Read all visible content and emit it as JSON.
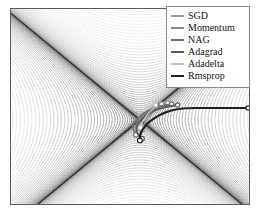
{
  "figure": {
    "kind": "contour-plot-with-trajectories",
    "frame_color": "#5a5a5a",
    "background_color": "#ffffff"
  },
  "legend": {
    "position": "top-right",
    "border_color": "#8a8a8a",
    "items": [
      {
        "label": "SGD",
        "color": "#9a9a9a",
        "width": 1.6
      },
      {
        "label": "Momentum",
        "color": "#8c8c8c",
        "width": 1.6
      },
      {
        "label": "NAG",
        "color": "#707070",
        "width": 1.8
      },
      {
        "label": "Adagrad",
        "color": "#5a5a5a",
        "width": 1.8
      },
      {
        "label": "Adadelta",
        "color": "#c2c2c2",
        "width": 1.6
      },
      {
        "label": "Rmsprop",
        "color": "#1e1e1e",
        "width": 2.2
      }
    ]
  },
  "chart_data": {
    "type": "line",
    "title": "",
    "xlabel": "",
    "ylabel": "",
    "xlim": [
      0,
      240
    ],
    "ylim": [
      0,
      197
    ],
    "grid": false,
    "legend_position": "top-right",
    "saddle_point": [
      130,
      112
    ],
    "contour": {
      "style": "thin grayscale level curves, dense near saddle ridges",
      "line_color_range": [
        "#d8d8d8",
        "#3a3a3a"
      ],
      "levels": 46,
      "families": [
        {
          "name": "upper-left-bands",
          "count": 16,
          "shade": "#9a9a9a"
        },
        {
          "name": "upper-right-bands",
          "count": 16,
          "shade": "#9a9a9a"
        },
        {
          "name": "lower-left-fan",
          "count": 15,
          "shade": "#c9c9c9"
        },
        {
          "name": "lower-right-fan",
          "count": 18,
          "shade": "#b5b5b5"
        },
        {
          "name": "central-vertical-ridge",
          "count": 13,
          "shade": "#6a6a6a"
        }
      ]
    },
    "series": [
      {
        "name": "SGD",
        "color": "#9a9a9a",
        "start": [
          152,
          96
        ],
        "end": [
          133,
          122
        ],
        "points": [
          [
            152,
            96
          ],
          [
            148,
            100
          ],
          [
            143,
            104
          ],
          [
            139,
            109
          ],
          [
            136,
            113
          ],
          [
            134,
            117
          ],
          [
            133,
            122
          ]
        ]
      },
      {
        "name": "Momentum",
        "color": "#8c8c8c",
        "start": [
          158,
          95
        ],
        "end": [
          128,
          125
        ],
        "points": [
          [
            158,
            95
          ],
          [
            150,
            99
          ],
          [
            141,
            103
          ],
          [
            133,
            108
          ],
          [
            127,
            114
          ],
          [
            126,
            120
          ],
          [
            128,
            125
          ]
        ]
      },
      {
        "name": "NAG",
        "color": "#707070",
        "start": [
          162,
          96
        ],
        "end": [
          126,
          127
        ],
        "points": [
          [
            162,
            96
          ],
          [
            152,
            98
          ],
          [
            142,
            101
          ],
          [
            133,
            106
          ],
          [
            126,
            112
          ],
          [
            122,
            119
          ],
          [
            126,
            127
          ]
        ]
      },
      {
        "name": "Adagrad",
        "color": "#5a5a5a",
        "start": [
          168,
          97
        ],
        "end": [
          132,
          131
        ],
        "points": [
          [
            168,
            97
          ],
          [
            155,
            99
          ],
          [
            143,
            103
          ],
          [
            133,
            110
          ],
          [
            126,
            118
          ],
          [
            127,
            126
          ],
          [
            132,
            131
          ]
        ]
      },
      {
        "name": "Adadelta",
        "color": "#c2c2c2",
        "start": [
          146,
          97
        ],
        "end": [
          131,
          120
        ],
        "points": [
          [
            146,
            97
          ],
          [
            143,
            101
          ],
          [
            139,
            105
          ],
          [
            136,
            109
          ],
          [
            133,
            113
          ],
          [
            131,
            117
          ],
          [
            131,
            120
          ]
        ]
      },
      {
        "name": "Rmsprop",
        "color": "#1e1e1e",
        "start": [
          239,
          100
        ],
        "end": [
          130,
          133
        ],
        "points": [
          [
            239,
            100
          ],
          [
            215,
            100
          ],
          [
            195,
            100
          ],
          [
            178,
            100
          ],
          [
            168,
            101
          ],
          [
            160,
            103
          ],
          [
            152,
            106
          ],
          [
            145,
            110
          ],
          [
            138,
            115
          ],
          [
            133,
            121
          ],
          [
            130,
            127
          ],
          [
            130,
            133
          ]
        ]
      }
    ]
  }
}
